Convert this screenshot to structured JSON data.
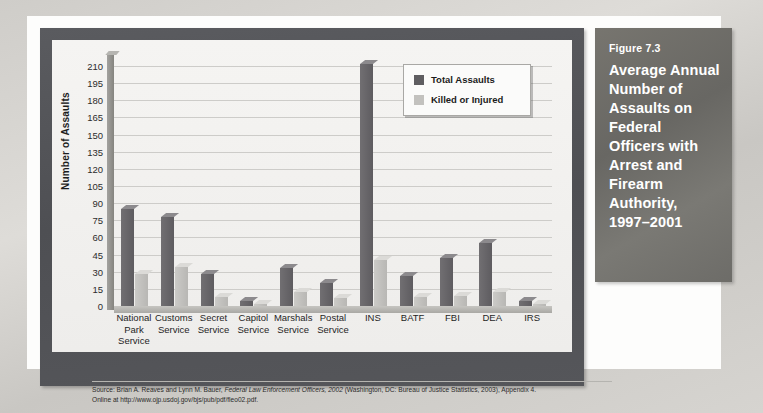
{
  "figure": {
    "number": "Figure 7.3",
    "title": "Average Annual Number of Assaults on Federal Officers with Arrest and Firearm Authority, 1997–2001"
  },
  "source": {
    "line1_pre": "Source: Brian A. Reaves and Lynn M. Bauer, ",
    "line1_italic": "Federal Law Enforcement Officers, 2002",
    "line1_post": " (Washington, DC: Bureau of Justice Statistics, 2003), Appendix 4.",
    "line2": "Online at http://www.ojp.usdoj.gov/bjs/pub/pdf/fleo02.pdf."
  },
  "chart_data": {
    "type": "bar",
    "title": "Average Annual Number of Assaults on Federal Officers with Arrest and Firearm Authority, 1997–2001",
    "xlabel": "",
    "ylabel": "Number of Assaults",
    "categories": [
      "National\nPark\nService",
      "Customs\nService",
      "Secret\nService",
      "Capitol\nService",
      "Marshals\nService",
      "Postal\nService",
      "INS",
      "BATF",
      "FBI",
      "DEA",
      "IRS"
    ],
    "series": [
      {
        "name": "Total Assaults",
        "color": "#5f5e61",
        "values": [
          85,
          78,
          28,
          4,
          33,
          20,
          212,
          26,
          42,
          55,
          4
        ]
      },
      {
        "name": "Killed or Injured",
        "color": "#c3c2bf",
        "values": [
          28,
          34,
          8,
          2,
          12,
          7,
          40,
          8,
          9,
          12,
          2
        ]
      }
    ],
    "ylim": [
      0,
      217
    ],
    "yticks": [
      0,
      15,
      30,
      45,
      60,
      75,
      90,
      105,
      120,
      135,
      150,
      165,
      180,
      195,
      210
    ],
    "grid": true,
    "legend_position": "top-right",
    "legend_entries": [
      "Total Assaults",
      "Killed or Injured"
    ]
  }
}
